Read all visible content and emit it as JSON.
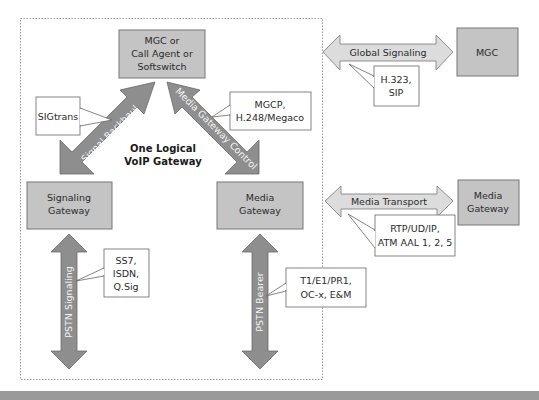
{
  "diagram": {
    "gateway_boundary_label": [
      "One Logical",
      "VoIP Gateway"
    ],
    "colors": {
      "box_fill": "#c4c4c4",
      "box_stroke": "#777777",
      "dark_arrow_fill": "#8e8e8e",
      "light_arrow_fill": "#dcdcdc",
      "callout_fill": "#ffffff",
      "bottom_bar": "#9a9a9a",
      "boundary_stroke": "#999999"
    },
    "nodes": {
      "mgc_center": {
        "lines": [
          "MGC or",
          "Call Agent or",
          "Softswitch"
        ]
      },
      "signaling_gateway": {
        "lines": [
          "Signaling",
          "Gateway"
        ]
      },
      "media_gateway": {
        "lines": [
          "Media",
          "Gateway"
        ]
      },
      "mgc_right": {
        "lines": [
          "MGC"
        ]
      },
      "media_gateway_right": {
        "lines": [
          "Media",
          "Gateway"
        ]
      }
    },
    "arrows": {
      "signal_backhaul": "Signal Backhaul",
      "media_gateway_control": "Media Gateway Control",
      "global_signaling": "Global Signaling",
      "media_transport": "Media Transport",
      "pstn_signaling": "PSTN Signaling",
      "pstn_bearer": "PSTN Bearer"
    },
    "callouts": {
      "sigtrans": {
        "lines": [
          "SIGtrans"
        ]
      },
      "mgcp": {
        "lines": [
          "MGCP,",
          "H.248/Megaco"
        ]
      },
      "h323": {
        "lines": [
          "H.323,",
          "SIP"
        ]
      },
      "rtp": {
        "lines": [
          "RTP/UD/IP,",
          "ATM AAL 1, 2, 5"
        ]
      },
      "ss7": {
        "lines": [
          "SS7,",
          "ISDN,",
          "Q.Sig"
        ]
      },
      "t1": {
        "lines": [
          "T1/E1/PR1,",
          "OC-x, E&M"
        ]
      }
    }
  }
}
